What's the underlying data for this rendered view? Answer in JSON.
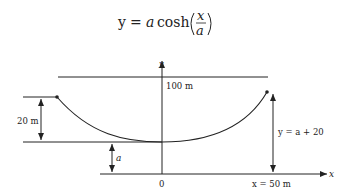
{
  "equation": {
    "lhs": "y",
    "eq": "=",
    "coef": "a",
    "func": "cosh",
    "num": "x",
    "den": "a"
  },
  "diagram": {
    "y_axis_label": "y",
    "x_axis_label": "x",
    "top_line_label": "100 m",
    "sag_label": "20 m",
    "a_label": "a",
    "right_height_label": "y = a + 20",
    "origin_label": "0",
    "x_end_label": "x = 50 m"
  },
  "colors": {
    "line": "#222222",
    "background": "#ffffff"
  }
}
